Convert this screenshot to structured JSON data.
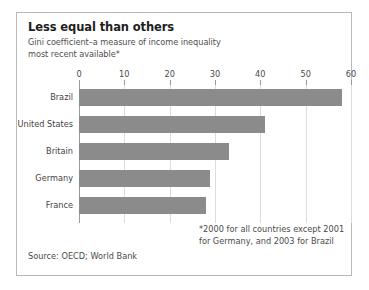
{
  "chart_data": {
    "type": "bar",
    "orientation": "horizontal",
    "title": "Less equal than others",
    "subtitle_lines": [
      "Gini coefficient–a measure of income inequality",
      "most recent available*"
    ],
    "categories": [
      "Brazil",
      "United States",
      "Britain",
      "Germany",
      "France"
    ],
    "values": [
      58,
      41,
      33,
      29,
      28
    ],
    "series": [
      {
        "name": "Gini coefficient",
        "values": [
          58,
          41,
          33,
          29,
          28
        ]
      }
    ],
    "xlabel": "",
    "ylabel": "",
    "xlim": [
      0,
      60
    ],
    "xticks": [
      0,
      10,
      20,
      30,
      40,
      50,
      60
    ],
    "xtick_labels": [
      "0",
      "10",
      "20",
      "30",
      "40",
      "50",
      "60"
    ],
    "grid": "vertical",
    "legend": "none",
    "bar_color": "#8b8b8b",
    "gridline_color": "#dcdcdc",
    "axis_color": "#9a9a9a",
    "frame_color": "#b9b9b9",
    "footnote": "*2000 for all countries except 2001 for Germany, and 2003 for Brazil",
    "footnote_lines": [
      "*2000 for all countries except 2001",
      "for Germany, and 2003 for Brazil"
    ],
    "source": "Source: OECD; World Bank"
  }
}
